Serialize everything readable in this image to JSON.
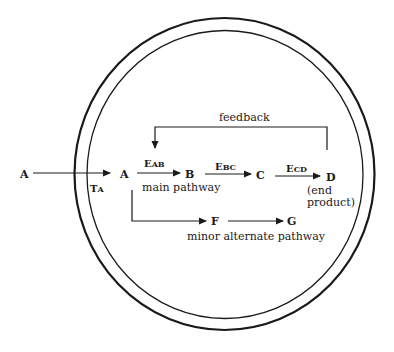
{
  "diagram": {
    "cell": {
      "outer_membrane": {
        "cx": 224.5,
        "cy": 174,
        "rx": 150,
        "ry": 156
      },
      "inner_membrane": {
        "cx": 225,
        "cy": 174.5,
        "rx": 138,
        "ry": 144
      }
    },
    "nodes": {
      "a_outside": "A",
      "a_inside": "A",
      "b": "B",
      "c": "C",
      "d": "D",
      "f": "F",
      "g": "G"
    },
    "enzymes": {
      "transporter": {
        "main": "T",
        "sub": "A"
      },
      "e_ab": {
        "main": "E",
        "sub": "AB"
      },
      "e_bc": {
        "main": "E",
        "sub": "BC"
      },
      "e_cd": {
        "main": "E",
        "sub": "CD"
      }
    },
    "labels": {
      "feedback": "feedback",
      "main_pathway": "main pathway",
      "end_product_line1": "(end",
      "end_product_line2": "product)",
      "minor_pathway": "minor alternate pathway"
    },
    "colors": {
      "ink": "#1a1a1a",
      "background": "#ffffff"
    }
  }
}
